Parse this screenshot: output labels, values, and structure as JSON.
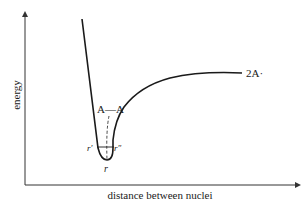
{
  "diagram": {
    "type": "potential-energy-curve",
    "y_axis_label": "energy",
    "x_axis_label": "distance between nuclei",
    "labels": {
      "bond": "A—A",
      "dissociated": "2A·",
      "left_turning_point": "r′",
      "right_turning_point": "r″",
      "equilibrium": "r"
    },
    "colors": {
      "line": "#1a1a1a",
      "background": "#ffffff"
    }
  }
}
